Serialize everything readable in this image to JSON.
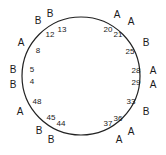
{
  "figure": {
    "type": "circular-position-diagram",
    "shape": "circle",
    "stroke_color": "#222222",
    "background_color": "#ffffff",
    "center": {
      "x": 81,
      "y": 76
    },
    "radius": 59
  },
  "chart_data": {
    "type": "scatter",
    "title": "",
    "xlabel": "",
    "ylabel": "",
    "categories": [
      "A",
      "B"
    ],
    "points": [
      {
        "number": "13",
        "letter": "B",
        "angle_deg": -68
      },
      {
        "number": "12",
        "letter": "B",
        "angle_deg": -79
      },
      {
        "number": "8",
        "letter": "A",
        "angle_deg": -121
      },
      {
        "number": "5",
        "letter": "B",
        "angle_deg": -156
      },
      {
        "number": "4",
        "letter": "B",
        "angle_deg": -172
      },
      {
        "number": "48",
        "letter": "A",
        "angle_deg": 158
      },
      {
        "number": "45",
        "letter": "B",
        "angle_deg": 122
      },
      {
        "number": "44",
        "letter": "B",
        "angle_deg": 109
      },
      {
        "number": "37",
        "letter": "A",
        "angle_deg": 68
      },
      {
        "number": "36",
        "letter": "A",
        "angle_deg": 58
      },
      {
        "number": "33",
        "letter": "B",
        "angle_deg": 35
      },
      {
        "number": "29",
        "letter": "A",
        "angle_deg": 10
      },
      {
        "number": "28",
        "letter": "A",
        "angle_deg": -4
      },
      {
        "number": "25",
        "letter": "B",
        "angle_deg": -30
      },
      {
        "number": "21",
        "letter": "A",
        "angle_deg": -55
      },
      {
        "number": "20",
        "letter": "A",
        "angle_deg": -66
      }
    ]
  },
  "numbers": [
    {
      "text": "12",
      "x": 50,
      "y": 35
    },
    {
      "text": "13",
      "x": 62,
      "y": 30
    },
    {
      "text": "8",
      "x": 38,
      "y": 51
    },
    {
      "text": "5",
      "x": 32,
      "y": 70
    },
    {
      "text": "4",
      "x": 32,
      "y": 82
    },
    {
      "text": "48",
      "x": 37,
      "y": 102
    },
    {
      "text": "45",
      "x": 51,
      "y": 118
    },
    {
      "text": "44",
      "x": 61,
      "y": 124
    },
    {
      "text": "37",
      "x": 108,
      "y": 124
    },
    {
      "text": "36",
      "x": 118,
      "y": 119
    },
    {
      "text": "33",
      "x": 131,
      "y": 102
    },
    {
      "text": "29",
      "x": 136,
      "y": 83
    },
    {
      "text": "28",
      "x": 136,
      "y": 71
    },
    {
      "text": "25",
      "x": 130,
      "y": 52
    },
    {
      "text": "20",
      "x": 108,
      "y": 30
    },
    {
      "text": "21",
      "x": 118,
      "y": 35
    }
  ],
  "letters": [
    {
      "text": "B",
      "x": 38,
      "y": 21
    },
    {
      "text": "B",
      "x": 50,
      "y": 14
    },
    {
      "text": "A",
      "x": 21,
      "y": 43
    },
    {
      "text": "B",
      "x": 13,
      "y": 70
    },
    {
      "text": "B",
      "x": 13,
      "y": 85
    },
    {
      "text": "A",
      "x": 20,
      "y": 112
    },
    {
      "text": "B",
      "x": 39,
      "y": 131
    },
    {
      "text": "B",
      "x": 51,
      "y": 140
    },
    {
      "text": "A",
      "x": 119,
      "y": 140
    },
    {
      "text": "A",
      "x": 131,
      "y": 132
    },
    {
      "text": "B",
      "x": 146,
      "y": 112
    },
    {
      "text": "A",
      "x": 153,
      "y": 85
    },
    {
      "text": "A",
      "x": 153,
      "y": 71
    },
    {
      "text": "B",
      "x": 146,
      "y": 43
    },
    {
      "text": "A",
      "x": 117,
      "y": 15
    },
    {
      "text": "A",
      "x": 131,
      "y": 22
    }
  ]
}
